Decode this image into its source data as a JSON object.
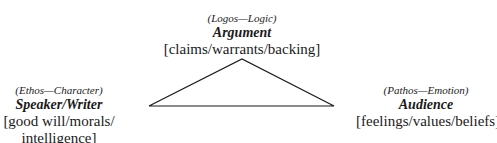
{
  "diagram": {
    "type": "rhetorical-triangle",
    "top": {
      "appeal": "(Logos—Logic)",
      "title": "Argument",
      "detail": "[claims/warrants/backing]"
    },
    "left": {
      "appeal": "(Ethos—Character)",
      "title": "Speaker/Writer",
      "detail_line1": "[good will/morals/",
      "detail_line2": "intelligence]"
    },
    "right": {
      "appeal": "(Pathos—Emotion)",
      "title": "Audience",
      "detail": "[feelings/values/beliefs]"
    },
    "line_color": "#1a1a1a"
  }
}
